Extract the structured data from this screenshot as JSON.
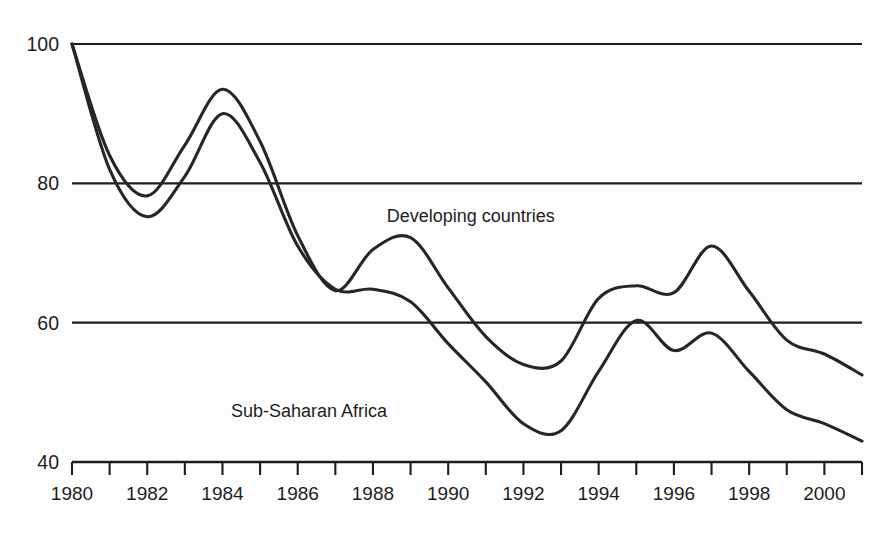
{
  "chart_data": {
    "type": "line",
    "title": "",
    "subtitle": "",
    "xlabel": "",
    "ylabel": "",
    "xlim": [
      1980,
      2001
    ],
    "ylim": [
      40,
      100
    ],
    "grid": true,
    "gridlines_y": [
      100,
      80,
      60
    ],
    "legend_position": "inline-annotations",
    "y_ticks": [
      100,
      80,
      60,
      40
    ],
    "y_tick_labels": [
      "100",
      "80",
      "60",
      "40"
    ],
    "x_ticks": [
      1980,
      1981,
      1982,
      1983,
      1984,
      1985,
      1986,
      1987,
      1988,
      1989,
      1990,
      1991,
      1992,
      1993,
      1994,
      1995,
      1996,
      1997,
      1998,
      1999,
      2000,
      2001
    ],
    "x_tick_labels_shown": [
      "1980",
      "1982",
      "1984",
      "1986",
      "1988",
      "1990",
      "1992",
      "1994",
      "1996",
      "1998",
      "2000"
    ],
    "x_tick_label_years": [
      1980,
      1982,
      1984,
      1986,
      1988,
      1990,
      1992,
      1994,
      1996,
      1998,
      2000
    ],
    "x": [
      1980,
      1981,
      1982,
      1983,
      1984,
      1985,
      1986,
      1987,
      1988,
      1989,
      1990,
      1991,
      1992,
      1993,
      1994,
      1995,
      1996,
      1997,
      1998,
      1999,
      2000,
      2001
    ],
    "series": [
      {
        "name": "Developing countries",
        "color": "#262626",
        "label_x": 1990.6,
        "label_y": 74.5,
        "values": [
          100.0,
          84.0,
          78.2,
          85.5,
          93.5,
          86.0,
          72.5,
          64.6,
          70.5,
          72.2,
          65.0,
          58.0,
          54.0,
          54.5,
          63.5,
          65.3,
          64.3,
          71.0,
          64.5,
          57.5,
          55.5,
          52.5
        ]
      },
      {
        "name": "Sub-Saharan Africa",
        "color": "#262626",
        "label_x": 1986.3,
        "label_y": 46.5,
        "values": [
          100.0,
          82.0,
          75.2,
          81.0,
          90.0,
          83.0,
          71.0,
          64.8,
          64.8,
          63.0,
          57.0,
          51.5,
          45.5,
          44.5,
          53.0,
          60.3,
          56.0,
          58.5,
          53.0,
          47.5,
          45.5,
          43.0
        ]
      }
    ],
    "annotations": [
      {
        "text": "Developing countries",
        "at_year": 1990.6,
        "at_value": 74.5
      },
      {
        "text": "Sub-Saharan Africa",
        "at_year": 1986.3,
        "at_value": 46.5
      }
    ]
  },
  "axes": {
    "y_labels": [
      "100",
      "80",
      "60",
      "40"
    ],
    "x_labels": [
      "1980",
      "1982",
      "1984",
      "1986",
      "1988",
      "1990",
      "1992",
      "1994",
      "1996",
      "1998",
      "2000"
    ]
  },
  "labels": {
    "developing": "Developing countries",
    "subsaharan": "Sub-Saharan Africa"
  }
}
